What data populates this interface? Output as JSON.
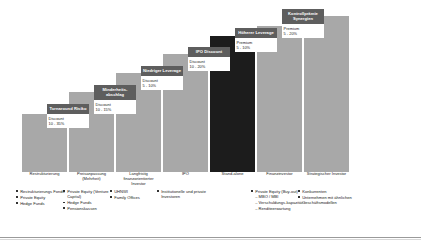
{
  "chart_data": {
    "type": "bar",
    "title": "",
    "xlabel": "",
    "ylabel": "",
    "grid": false,
    "legend": "none",
    "ylim": [
      0,
      160
    ],
    "categories": [
      "Restrukturierung",
      "Preisanpassung (Mehrheit)",
      "Langfristig finanzorientierter Investor",
      "IPO",
      "Stand-alone",
      "Finanzinvestor",
      "Strategischer Investor"
    ],
    "values": [
      58,
      80,
      99,
      118,
      136,
      146,
      156
    ],
    "annotations": [
      {
        "tag": "Turnaround Risiko",
        "pct_label": "Discount",
        "pct_range": "10 - 35%"
      },
      {
        "tag": "Minderheitsabschlag",
        "pct_label": "Discount",
        "pct_range": "10 - 15%"
      },
      {
        "tag": "Niedriger Leverage",
        "pct_label": "Discount",
        "pct_range": "5 - 10%"
      },
      {
        "tag": "IPO Discount",
        "pct_label": "Discount",
        "pct_range": "10 - 20%"
      },
      {
        "tag": "Höherer Leverage",
        "pct_label": "Premium",
        "pct_range": "5 - 10%"
      },
      {
        "tag": "Kontrollprämie Synergien",
        "pct_label": "Premium",
        "pct_range": "5 - 20%"
      }
    ],
    "colors": {
      "bar": "#a8a8a8",
      "bar_standalone": "#1c1c1c",
      "tag_box": "#5e5e5e",
      "tag_text": "#ffffff"
    }
  },
  "bars": [
    {
      "category": "Restrukturierung",
      "tag": "",
      "pct_label": "",
      "pct_range": ""
    },
    {
      "category": "Preisanpassung (Mehrheit)",
      "tag": "Turnaround Risiko",
      "pct_label": "Discount",
      "pct_range": "10 - 35%"
    },
    {
      "category": "Langfristig finanzorientierter Investor",
      "tag": "Minderheits-abschlag",
      "pct_label": "Discount",
      "pct_range": "10 - 15%"
    },
    {
      "category": "IPO",
      "tag": "Niedriger Leverage",
      "pct_label": "Discount",
      "pct_range": "5 - 10%"
    },
    {
      "category": "Stand-alone",
      "tag": "IPO Discount",
      "pct_label": "Discount",
      "pct_range": "10 - 20%"
    },
    {
      "category": "Finanzinvestor",
      "tag": "Höherer Leverage",
      "pct_label": "Premium",
      "pct_range": "5 - 10%"
    },
    {
      "category": "Strategischer Investor",
      "tag": "Kontrollprämie Synergien",
      "pct_label": "Premium",
      "pct_range": "5 - 20%"
    }
  ],
  "categories": [
    {
      "line1": "Restrukturierung",
      "line2": ""
    },
    {
      "line1": "Preisanpassung",
      "line2": "(Mehrheit)"
    },
    {
      "line1": "Langfristig",
      "line2": "finanzorientierter",
      "line3": "Investor"
    },
    {
      "line1": "IPO",
      "line2": ""
    },
    {
      "line1": "Stand-alone",
      "line2": ""
    },
    {
      "line1": "Finanzinvestor",
      "line2": ""
    },
    {
      "line1": "Strategischer Investor",
      "line2": ""
    }
  ],
  "bullets": [
    {
      "items": [
        {
          "text": "Restrukturierungs Fonds",
          "subs": []
        },
        {
          "text": "Private Equity",
          "subs": []
        },
        {
          "text": "Hedge Funds",
          "subs": []
        }
      ]
    },
    {
      "items": [
        {
          "text": "Private Equity (Venture Capital)",
          "subs": []
        },
        {
          "text": "Hedge Funds",
          "subs": []
        },
        {
          "text": "Pensionskassen",
          "subs": []
        }
      ]
    },
    {
      "items": [
        {
          "text": "UHNWI",
          "subs": []
        },
        {
          "text": "Family Offices",
          "subs": []
        }
      ]
    },
    {
      "items": [
        {
          "text": "Institutionelle und private Investoren",
          "subs": []
        }
      ]
    },
    {
      "items": []
    },
    {
      "items": [
        {
          "text": "Private Equity (Buy-out)",
          "subs": [
            "MBO / MBI",
            "Verschuldungs-kapazität",
            "Renditeerwartung"
          ]
        }
      ]
    },
    {
      "items": [
        {
          "text": "Konkurrenten",
          "subs": []
        },
        {
          "text": "Unternehmen mit ähnlichen Geschäftsmodellen",
          "subs": []
        }
      ]
    }
  ]
}
